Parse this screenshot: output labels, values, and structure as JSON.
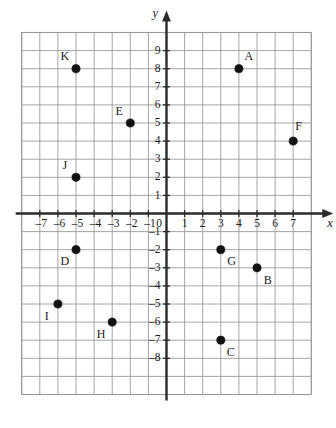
{
  "figure": {
    "type": "coordinate-plane",
    "axis_labels": {
      "x": "x",
      "y": "y"
    },
    "origin_label": "0",
    "minus_sign": "–",
    "grid": {
      "visible": true,
      "cell_size_units": 1,
      "x_min": -8,
      "x_max": 8,
      "y_min": -10,
      "y_max": 10
    },
    "x_ticks": [
      {
        "value": -7,
        "label": "–7"
      },
      {
        "value": -6,
        "label": "–6"
      },
      {
        "value": -5,
        "label": "–5"
      },
      {
        "value": -4,
        "label": "–4"
      },
      {
        "value": -3,
        "label": "–3"
      },
      {
        "value": -2,
        "label": "–2"
      },
      {
        "value": -1,
        "label": "–1"
      },
      {
        "value": 0,
        "label": "0"
      },
      {
        "value": 1,
        "label": "1"
      },
      {
        "value": 2,
        "label": "2"
      },
      {
        "value": 3,
        "label": "3"
      },
      {
        "value": 4,
        "label": "4"
      },
      {
        "value": 5,
        "label": "5"
      },
      {
        "value": 6,
        "label": "6"
      },
      {
        "value": 7,
        "label": "7"
      }
    ],
    "y_ticks": [
      {
        "value": 9,
        "label": "9"
      },
      {
        "value": 8,
        "label": "8"
      },
      {
        "value": 7,
        "label": "7"
      },
      {
        "value": 6,
        "label": "6"
      },
      {
        "value": 5,
        "label": "5"
      },
      {
        "value": 4,
        "label": "4"
      },
      {
        "value": 3,
        "label": "3"
      },
      {
        "value": 2,
        "label": "2"
      },
      {
        "value": 1,
        "label": "1"
      },
      {
        "value": -1,
        "label": "–1"
      },
      {
        "value": -2,
        "label": "–2"
      },
      {
        "value": -3,
        "label": "–3"
      },
      {
        "value": -4,
        "label": "–4"
      },
      {
        "value": -5,
        "label": "–5"
      },
      {
        "value": -6,
        "label": "–6"
      },
      {
        "value": -7,
        "label": "–7"
      },
      {
        "value": -8,
        "label": "–8"
      }
    ]
  },
  "chart_data": {
    "type": "scatter",
    "title": "",
    "xlabel": "x",
    "ylabel": "y",
    "xlim": [
      -8,
      8
    ],
    "ylim": [
      -10,
      10
    ],
    "grid": true,
    "legend": "none",
    "points": [
      {
        "label": "A",
        "x": 4,
        "y": 8,
        "label_dx": 0.55,
        "label_dy": 0.62
      },
      {
        "label": "B",
        "x": 5,
        "y": -3,
        "label_dx": 0.6,
        "label_dy": -0.72
      },
      {
        "label": "C",
        "x": 3,
        "y": -7,
        "label_dx": 0.55,
        "label_dy": -0.72
      },
      {
        "label": "D",
        "x": -5,
        "y": -2,
        "label_dx": -0.62,
        "label_dy": -0.72
      },
      {
        "label": "E",
        "x": -2,
        "y": 5,
        "label_dx": -0.62,
        "label_dy": 0.62
      },
      {
        "label": "F",
        "x": 7,
        "y": 4,
        "label_dx": 0.3,
        "label_dy": 0.78
      },
      {
        "label": "G",
        "x": 3,
        "y": -2,
        "label_dx": 0.6,
        "label_dy": -0.72
      },
      {
        "label": "H",
        "x": -3,
        "y": -6,
        "label_dx": -0.62,
        "label_dy": -0.72
      },
      {
        "label": "I",
        "x": -6,
        "y": -5,
        "label_dx": -0.62,
        "label_dy": -0.72
      },
      {
        "label": "J",
        "x": -5,
        "y": 2,
        "label_dx": -0.62,
        "label_dy": 0.62
      },
      {
        "label": "K",
        "x": -5,
        "y": 8,
        "label_dx": -0.62,
        "label_dy": 0.62
      }
    ]
  },
  "style": {
    "grid_color": "#9a9a9a",
    "axis_color": "#2b2b2b",
    "point_color": "#111111",
    "text_color": "#1a1a1a",
    "background": "#ffffff"
  }
}
